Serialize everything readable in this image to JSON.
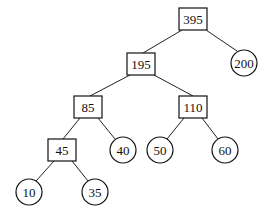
{
  "diagram": {
    "type": "huffman-tree",
    "internal_nodes": [
      {
        "id": "n395",
        "label": "395",
        "shape": "box",
        "x": 193,
        "y": 19
      },
      {
        "id": "n195",
        "label": "195",
        "shape": "box",
        "x": 141,
        "y": 64
      },
      {
        "id": "n85",
        "label": "85",
        "shape": "box",
        "x": 88,
        "y": 107
      },
      {
        "id": "n110",
        "label": "110",
        "shape": "box",
        "x": 193,
        "y": 107
      },
      {
        "id": "n45",
        "label": "45",
        "shape": "box",
        "x": 62,
        "y": 150
      }
    ],
    "leaf_nodes": [
      {
        "id": "l200",
        "label": "200",
        "shape": "circle",
        "x": 244,
        "y": 63
      },
      {
        "id": "l40",
        "label": "40",
        "shape": "circle",
        "x": 123,
        "y": 150
      },
      {
        "id": "l50",
        "label": "50",
        "shape": "circle",
        "x": 160,
        "y": 150
      },
      {
        "id": "l60",
        "label": "60",
        "shape": "circle",
        "x": 225,
        "y": 150
      },
      {
        "id": "l10",
        "label": "10",
        "shape": "circle",
        "x": 29,
        "y": 192
      },
      {
        "id": "l35",
        "label": "35",
        "shape": "circle",
        "x": 95,
        "y": 192
      }
    ],
    "edges": [
      [
        "n395",
        "n195"
      ],
      [
        "n395",
        "l200"
      ],
      [
        "n195",
        "n85"
      ],
      [
        "n195",
        "n110"
      ],
      [
        "n85",
        "n45"
      ],
      [
        "n85",
        "l40"
      ],
      [
        "n110",
        "l50"
      ],
      [
        "n110",
        "l60"
      ],
      [
        "n45",
        "l10"
      ],
      [
        "n45",
        "l35"
      ]
    ]
  }
}
